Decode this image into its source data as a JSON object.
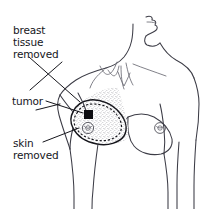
{
  "figure": {
    "background_color": "#ffffff",
    "line_color": "#3c3c46",
    "accent_color": "#16161c",
    "width": 220,
    "height": 209
  },
  "labels": {
    "breast_tissue_removed": {
      "lines": [
        "breast",
        "tissue",
        "removed"
      ],
      "line1": "breast",
      "line2": "tissue",
      "line3": "removed"
    },
    "tumor": {
      "text": "tumor"
    },
    "skin_removed": {
      "lines": [
        "skin",
        "removed"
      ],
      "line1": "skin",
      "line2": "removed"
    }
  },
  "markers": {
    "tumor_shape": "filled-square",
    "excision_margin_style": "dashed-ellipse",
    "removed_tissue_style": "stippled-wedge",
    "nipple_shape": "small-circle"
  }
}
